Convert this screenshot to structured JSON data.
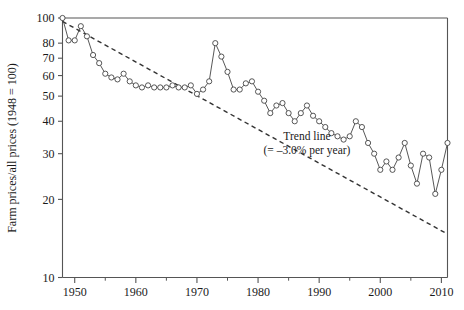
{
  "chart_data": {
    "type": "line",
    "title": "",
    "xlabel": "",
    "ylabel": "Farm prices/all prices (1948 = 100)",
    "yscale": "log",
    "ylim": [
      10,
      100
    ],
    "xlim": [
      1948,
      2011
    ],
    "grid": false,
    "legend": "none",
    "ytick_labels": [
      "100",
      "80",
      "70",
      "60",
      "50",
      "40",
      "30",
      "20",
      "10"
    ],
    "ytick_values": [
      100,
      80,
      70,
      60,
      50,
      40,
      30,
      20,
      10
    ],
    "xtick_labels": [
      "1950",
      "1960",
      "1970",
      "1980",
      "1990",
      "2000",
      "2010"
    ],
    "xtick_values": [
      1950,
      1960,
      1970,
      1980,
      1990,
      2000,
      2010
    ],
    "xminor_ticks": [
      1955,
      1965,
      1975,
      1985,
      1995,
      2005
    ],
    "annotations": [
      {
        "name": "trend-line-label",
        "line1": "Trend line",
        "line2": "(= –3.0% per year)",
        "x": 1988,
        "y": 34
      }
    ],
    "series": [
      {
        "name": "Farm prices relative to all prices",
        "marker": "open-circle",
        "x": [
          1948,
          1949,
          1950,
          1951,
          1952,
          1953,
          1954,
          1955,
          1956,
          1957,
          1958,
          1959,
          1960,
          1961,
          1962,
          1963,
          1964,
          1965,
          1966,
          1967,
          1968,
          1969,
          1970,
          1971,
          1972,
          1973,
          1974,
          1975,
          1976,
          1977,
          1978,
          1979,
          1980,
          1981,
          1982,
          1983,
          1984,
          1985,
          1986,
          1987,
          1988,
          1989,
          1990,
          1991,
          1992,
          1993,
          1994,
          1995,
          1996,
          1997,
          1998,
          1999,
          2000,
          2001,
          2002,
          2003,
          2004,
          2005,
          2006,
          2007,
          2008,
          2009,
          2010,
          2011
        ],
        "values": [
          100,
          82,
          82,
          93,
          85,
          72,
          67,
          61,
          59,
          58,
          61,
          57,
          55,
          54,
          55,
          54,
          54,
          54,
          55,
          54,
          54,
          55,
          51,
          53,
          57,
          80,
          71,
          62,
          53,
          53,
          56,
          57,
          52,
          48,
          43,
          46,
          47,
          43,
          40,
          43,
          46,
          42,
          40,
          38,
          36,
          35,
          34,
          35,
          40,
          38,
          33,
          30,
          26,
          28,
          26,
          29,
          33,
          27,
          23,
          30,
          29,
          21,
          26,
          33
        ]
      },
      {
        "name": "Trend line",
        "style": "dashed",
        "x": [
          1948,
          2011
        ],
        "values": [
          97,
          14.7
        ]
      }
    ]
  },
  "axis": {
    "y_axis_title": "Farm prices/all prices (1948 = 100)"
  }
}
